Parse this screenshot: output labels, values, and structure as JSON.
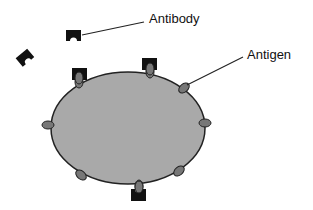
{
  "diagram": {
    "labels": {
      "antibody": "Antibody",
      "antigen": "Antigen"
    },
    "colors": {
      "cell_fill": "#a9a9a9",
      "cell_stroke": "#222222",
      "antigen_fill": "#777777",
      "antibody_fill": "#111111",
      "line": "#222222"
    }
  }
}
